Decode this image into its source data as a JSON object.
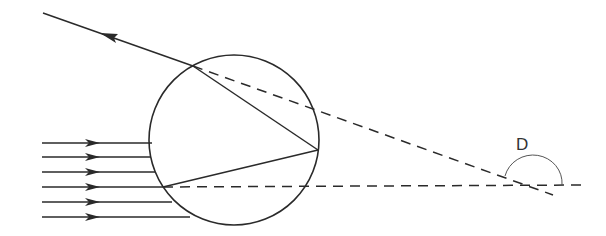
{
  "diagram": {
    "label_D": "D",
    "colors": {
      "stroke": "#2a2a2a",
      "arc": "#555555",
      "background": "#ffffff"
    },
    "droplet": {
      "cx": 234,
      "cy": 140,
      "r": 85
    },
    "incident_rays_y": [
      143,
      157,
      172,
      187,
      202,
      217
    ],
    "incident_ray_start_x": 42,
    "entry_point": [
      163,
      187
    ],
    "reflection_point": [
      318,
      150
    ],
    "exit_point": [
      193,
      66
    ],
    "exit_ray_end": [
      43,
      13
    ],
    "intersection_point": [
      528,
      185
    ],
    "horizontal_dashed_end": [
      584,
      185
    ],
    "diagonal_dashed_end": [
      553,
      195
    ]
  }
}
